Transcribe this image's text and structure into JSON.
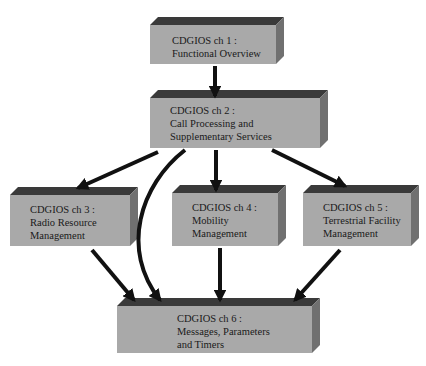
{
  "diagram": {
    "colors": {
      "front": "#a9a9a9",
      "top": "#3a3a3a",
      "side": "#707070",
      "arrow": "#111111",
      "text": "#1a1a1a"
    },
    "boxes": [
      {
        "id": "ch1",
        "lines": [
          "CDGIOS ch 1 :",
          "Functional Overview"
        ],
        "x": 150,
        "y": 25,
        "w": 126,
        "h": 39,
        "tx": 22,
        "ty": 9
      },
      {
        "id": "ch2",
        "lines": [
          "CDGIOS ch 2 :",
          "Call Processing and",
          "Supplementary Services"
        ],
        "x": 150,
        "y": 98,
        "w": 170,
        "h": 50,
        "tx": 20,
        "ty": 6
      },
      {
        "id": "ch3",
        "lines": [
          "CDGIOS ch 3 :",
          "Radio Resource",
          "Management"
        ],
        "x": 10,
        "y": 195,
        "w": 120,
        "h": 51,
        "tx": 20,
        "ty": 8
      },
      {
        "id": "ch4",
        "lines": [
          "CDGIOS ch 4 :",
          "Mobility",
          "Management"
        ],
        "x": 172,
        "y": 193,
        "w": 106,
        "h": 53,
        "tx": 20,
        "ty": 8
      },
      {
        "id": "ch5",
        "lines": [
          "CDGIOS ch 5 :",
          "Terrestrial Facility",
          "Management"
        ],
        "x": 303,
        "y": 193,
        "w": 108,
        "h": 53,
        "tx": 20,
        "ty": 8
      },
      {
        "id": "ch6",
        "lines": [
          "CDGIOS ch 6 :",
          "Messages, Parameters",
          "and Timers"
        ],
        "x": 117,
        "y": 306,
        "w": 195,
        "h": 47,
        "tx": 60,
        "ty": 6
      }
    ],
    "arrows": [
      {
        "from": "ch1",
        "to": "ch2",
        "path": "M 215 66 L 215 96"
      },
      {
        "from": "ch2",
        "to": "ch3",
        "path": "M 158 152 L 78 188"
      },
      {
        "from": "ch2",
        "to": "ch4",
        "path": "M 216 150 L 216 190"
      },
      {
        "from": "ch2",
        "to": "ch5",
        "path": "M 272 150 L 345 186"
      },
      {
        "from": "ch2",
        "to": "ch6",
        "path": "M 185 150 C 140 185, 120 250, 160 300"
      },
      {
        "from": "ch3",
        "to": "ch6",
        "path": "M 92 250 L 134 300"
      },
      {
        "from": "ch4",
        "to": "ch6",
        "path": "M 220 248 L 220 300"
      },
      {
        "from": "ch5",
        "to": "ch6",
        "path": "M 340 250 L 295 300"
      }
    ]
  }
}
